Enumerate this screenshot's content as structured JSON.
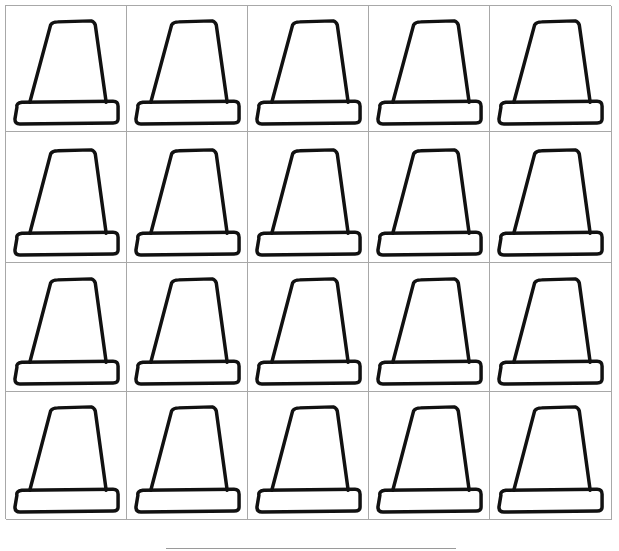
{
  "worksheet": {
    "rows": 4,
    "columns": 5,
    "cell_count": 20,
    "cell_icon": "pilgrim-hat-outline-icon",
    "grid_line_color": "#a8a8a8",
    "ink_color": "#111111"
  },
  "footer": {
    "name_line_label": ""
  }
}
